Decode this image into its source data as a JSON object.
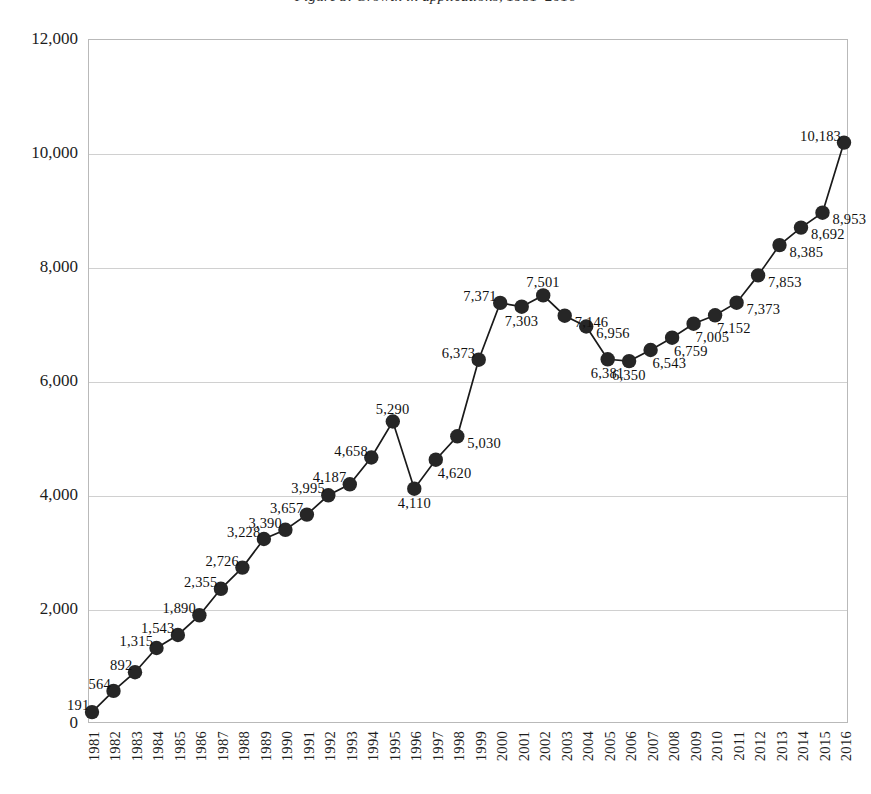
{
  "chart_title": "Figure 3. Growth in applications, 1981–2016",
  "axes": {
    "y_ticks": [
      "0",
      "2,000",
      "4,000",
      "6,000",
      "8,000",
      "10,000",
      "12,000"
    ],
    "y_values": [
      0,
      2000,
      4000,
      6000,
      8000,
      10000,
      12000
    ],
    "y_min": 0,
    "y_max": 12000,
    "gridlines": true
  },
  "marker_color": "#262626",
  "line_color": "#1a1a1a",
  "gridline_color": "#d0d0d0",
  "frame_color": "#b9b9b9",
  "chart_data": {
    "type": "line",
    "title": "Figure 3. Growth in applications, 1981–2016",
    "xlabel": "",
    "ylabel": "",
    "ylim": [
      0,
      12000
    ],
    "grid": true,
    "legend": false,
    "categories": [
      "1981",
      "1982",
      "1983",
      "1984",
      "1985",
      "1986",
      "1987",
      "1988",
      "1989",
      "1990",
      "1991",
      "1992",
      "1993",
      "1994",
      "1995",
      "1996",
      "1997",
      "1998",
      "1999",
      "2000",
      "2001",
      "2002",
      "2003",
      "2004",
      "2005",
      "2006",
      "2007",
      "2008",
      "2009",
      "2010",
      "2011",
      "2012",
      "2013",
      "2014",
      "2015",
      "2016"
    ],
    "values": [
      191,
      564,
      892,
      1315,
      1543,
      1890,
      2355,
      2726,
      3228,
      3390,
      3657,
      3995,
      4187,
      4658,
      5290,
      4110,
      4620,
      5030,
      6373,
      7371,
      7303,
      7501,
      7146,
      6956,
      6381,
      6350,
      6543,
      6759,
      7005,
      7152,
      7373,
      7853,
      8385,
      8692,
      8953,
      10183
    ],
    "labels": [
      "191",
      "564",
      "892",
      "1,315",
      "1,543",
      "1,890",
      "2,355",
      "2,726",
      "3,228",
      "3,390",
      "3,657",
      "3,995",
      "4,187",
      "4,658",
      "5,290",
      "4,110",
      "4,620",
      "5,030",
      "6,373",
      "7,371",
      "7,303",
      "7,501",
      "7,146",
      "6,956",
      "6,381",
      "6,350",
      "6,543",
      "6,759",
      "7,005",
      "7,152",
      "7,373",
      "7,853",
      "8,385",
      "8,692",
      "8,953",
      "10,183"
    ],
    "label_positions": [
      "above-left",
      "above-left",
      "above-left",
      "above-left",
      "above-left",
      "above-left",
      "above-left",
      "above-left",
      "above-left",
      "above-left",
      "above-left",
      "above-left",
      "above-left",
      "above-left",
      "above",
      "below",
      "below-right",
      "right",
      "above-left",
      "above-left",
      "below",
      "above",
      "right",
      "right",
      "below",
      "below",
      "below-right",
      "below-right",
      "below-right",
      "below-right",
      "right",
      "right",
      "right",
      "right",
      "right",
      "above-left"
    ]
  }
}
